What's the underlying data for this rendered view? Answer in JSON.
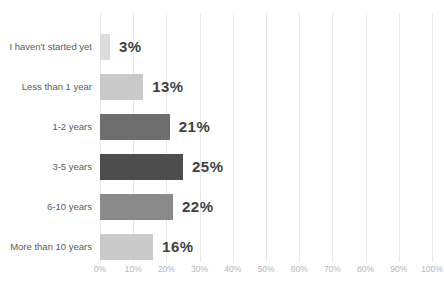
{
  "chart_data": {
    "type": "bar",
    "orientation": "horizontal",
    "title": "",
    "subtitle": "",
    "xlabel": "",
    "ylabel": "",
    "xlim": [
      0,
      100
    ],
    "grid": true,
    "legend": false,
    "categories": [
      "I haven't started yet",
      "Less than 1 year",
      "1-2 years",
      "3-5 years",
      "6-10 years",
      "More than 10 years"
    ],
    "values": [
      3,
      13,
      21,
      25,
      22,
      16
    ],
    "value_labels": [
      "3%",
      "13%",
      "21%",
      "25%",
      "22%",
      "16%"
    ],
    "bar_colors": [
      "#dcdcdc",
      "#c9c9c9",
      "#6e6e6e",
      "#4d4d4d",
      "#8a8a8a",
      "#cacaca"
    ],
    "xticks": [
      0,
      10,
      20,
      30,
      40,
      50,
      60,
      70,
      80,
      90,
      100
    ],
    "xtick_labels": [
      "0%",
      "10%",
      "20%",
      "30%",
      "40%",
      "50%",
      "60%",
      "70%",
      "80%",
      "90%",
      "100%"
    ],
    "colors": {
      "background": "#ffffff",
      "gridline": "#e9e9ec",
      "category_text": "#5b5b5b",
      "value_text": "#3f3f3f",
      "tick_text": "#b6b6bb"
    }
  }
}
